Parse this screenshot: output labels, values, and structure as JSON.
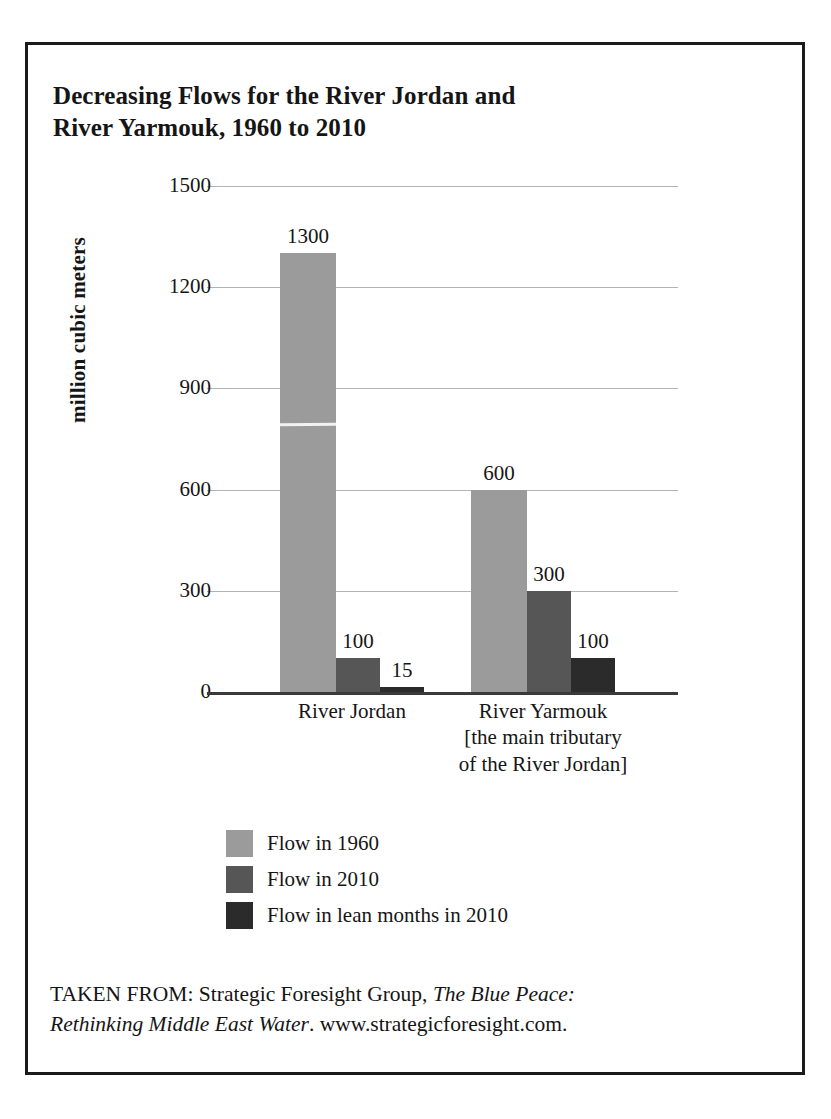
{
  "figure": {
    "title_line1": "Decreasing Flows for the River Jordan and",
    "title_line2": "River Yarmouk, 1960 to 2010",
    "border_color": "#1b1b1b"
  },
  "source_note": {
    "prefix": "TAKEN FROM: Strategic Foresight Group, ",
    "work_title_line1": "The Blue Peace:",
    "work_title_line2": "Rethinking Middle East Water",
    "suffix": ". www.strategicforesight.com."
  },
  "legend": {
    "items": [
      {
        "label": "Flow in 1960",
        "color": "#9b9b9b"
      },
      {
        "label": "Flow in 2010",
        "color": "#565656"
      },
      {
        "label": "Flow in lean months in 2010",
        "color": "#2b2b2b"
      }
    ]
  },
  "chart_data": {
    "type": "bar",
    "title": "Decreasing Flows for the River Jordan and River Yarmouk, 1960 to 2010",
    "xlabel": "",
    "ylabel": "million cubic meters",
    "ylim": [
      0,
      1500
    ],
    "yticks": [
      0,
      300,
      600,
      900,
      1200,
      1500
    ],
    "ytick_labels": [
      "0",
      "300",
      "600",
      "900",
      "1200",
      "1500"
    ],
    "grid": true,
    "legend_position": "below-plot-left",
    "categories": [
      "River Jordan",
      "River Yarmouk"
    ],
    "category_labels": [
      [
        "River Jordan"
      ],
      [
        "River Yarmouk",
        "[the main tributary",
        "of the River Jordan]"
      ]
    ],
    "series": [
      {
        "name": "Flow in 1960",
        "color": "#9b9b9b",
        "values": [
          1300,
          600
        ]
      },
      {
        "name": "Flow in 2010",
        "color": "#565656",
        "values": [
          100,
          300
        ]
      },
      {
        "name": "Flow in lean months in 2010",
        "color": "#2b2b2b",
        "values": [
          15,
          100
        ]
      }
    ],
    "data_labels": {
      "River Jordan": [
        "1300",
        "100",
        "15"
      ],
      "River Yarmouk": [
        "600",
        "300",
        "100"
      ]
    },
    "axis_line_color": "#3a3a3a",
    "grid_color": "#b4b4b4"
  }
}
